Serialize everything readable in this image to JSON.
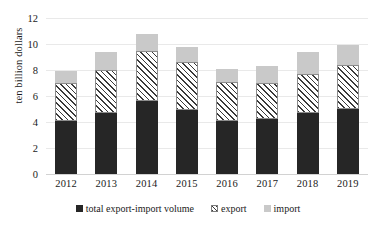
{
  "chart_data": {
    "type": "bar",
    "stacked": true,
    "title": "",
    "xlabel": "",
    "ylabel": "ten billion dollars",
    "ylim": [
      0,
      12
    ],
    "yticks": [
      0,
      2,
      4,
      6,
      8,
      10,
      12
    ],
    "grid": true,
    "legend_position": "bottom",
    "categories": [
      "2012",
      "2013",
      "2014",
      "2015",
      "2016",
      "2017",
      "2018",
      "2019"
    ],
    "series": [
      {
        "name": "total export-import volume",
        "color": "#262626",
        "pattern": "solid",
        "values": [
          4.1,
          4.7,
          5.6,
          4.9,
          4.1,
          4.2,
          4.7,
          5.0
        ]
      },
      {
        "name": "export",
        "color": "#ffffff",
        "pattern": "diagonal-hatch",
        "values": [
          2.9,
          3.3,
          3.9,
          3.7,
          3.0,
          2.8,
          3.0,
          3.4
        ]
      },
      {
        "name": "import",
        "color": "#c9c9c9",
        "pattern": "solid",
        "values": [
          0.9,
          1.4,
          1.3,
          1.2,
          1.0,
          1.3,
          1.7,
          1.5
        ]
      }
    ],
    "stack_totals": [
      7.9,
      9.4,
      10.8,
      9.8,
      8.1,
      8.3,
      9.4,
      9.9
    ]
  },
  "axis": {
    "y_title": "ten billion dollars",
    "y_tick_labels": [
      "12",
      "10",
      "8",
      "6",
      "4",
      "2",
      "0"
    ],
    "x_tick_labels": [
      "2012",
      "2013",
      "2014",
      "2015",
      "2016",
      "2017",
      "2018",
      "2019"
    ]
  },
  "legend": {
    "items": [
      {
        "label": "total export-import volume",
        "swatch": "total-swatch-icon"
      },
      {
        "label": "export",
        "swatch": "export-swatch-icon"
      },
      {
        "label": "import",
        "swatch": "import-swatch-icon"
      }
    ]
  }
}
